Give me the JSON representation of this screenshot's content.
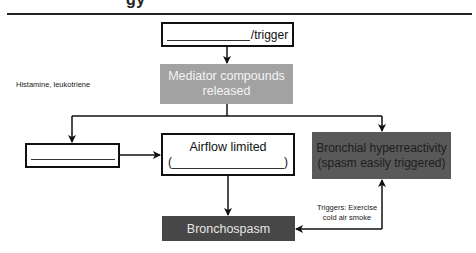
{
  "header": {
    "heading_fragment": "gy"
  },
  "diagram": {
    "nodes": {
      "trigger": {
        "blank": "",
        "suffix": "/trigger"
      },
      "mediator": {
        "line1": "Mediator compounds",
        "line2": "released",
        "color": "#a2a2a2"
      },
      "left_blank": {
        "blank": ""
      },
      "airflow": {
        "title": "Airflow limited",
        "paren_open": "(",
        "blank": "",
        "paren_close": ")"
      },
      "bronchial": {
        "line1": "Bronchial hyperreactivity",
        "line2": "(spasm easily triggered)",
        "color": "#595959"
      },
      "bronchospasm": {
        "label": "Bronchospasm",
        "color": "#474747"
      }
    },
    "labels": {
      "histamine": "Histamine, leukotriene",
      "triggers_line1": "Triggers: Exercise",
      "triggers_line2": "cold air smoke"
    },
    "edges": [
      {
        "from": "trigger",
        "to": "mediator"
      },
      {
        "from": "mediator",
        "to": "left_blank"
      },
      {
        "from": "mediator",
        "to": "bronchial"
      },
      {
        "from": "left_blank",
        "to": "airflow"
      },
      {
        "from": "airflow",
        "to": "bronchospasm"
      },
      {
        "from": "bronchial",
        "to": "bronchospasm",
        "bidirectional": true
      }
    ]
  }
}
